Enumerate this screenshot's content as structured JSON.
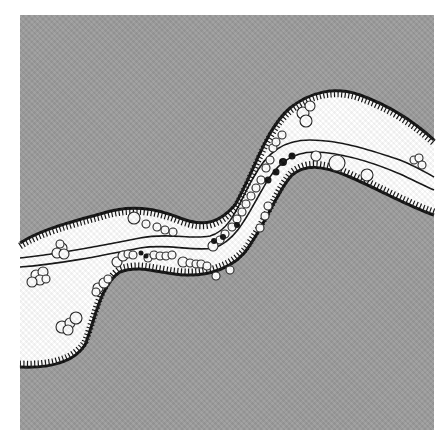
{
  "figure": {
    "colors": {
      "background": "#ffffff",
      "upland": "#9c9c9c",
      "floodplain": "#ffffff",
      "bank_edge": "#111111",
      "channel_line": "#111111",
      "open_circle": "#222222",
      "filled_dot": "#111111"
    },
    "frame": {
      "x": 20,
      "y": 15,
      "width": 414,
      "height": 415
    },
    "open_circles": [
      [
        62,
        248,
        5
      ],
      [
        57,
        253,
        5
      ],
      [
        64,
        254,
        5
      ],
      [
        60,
        244,
        4
      ],
      [
        36,
        275,
        5
      ],
      [
        43,
        272,
        5
      ],
      [
        40,
        280,
        5
      ],
      [
        32,
        282,
        5
      ],
      [
        46,
        279,
        4
      ],
      [
        62,
        327,
        6
      ],
      [
        70,
        323,
        5
      ],
      [
        76,
        318,
        6
      ],
      [
        68,
        330,
        5
      ],
      [
        98,
        288,
        5
      ],
      [
        104,
        283,
        5
      ],
      [
        108,
        279,
        4
      ],
      [
        96,
        292,
        4
      ],
      [
        117,
        262,
        5
      ],
      [
        123,
        256,
        5
      ],
      [
        128,
        254,
        4
      ],
      [
        133,
        255,
        4
      ],
      [
        148,
        258,
        4
      ],
      [
        154,
        255,
        4
      ],
      [
        160,
        256,
        4
      ],
      [
        166,
        256,
        4
      ],
      [
        172,
        255,
        4
      ],
      [
        183,
        262,
        5
      ],
      [
        190,
        263,
        4
      ],
      [
        196,
        264,
        4
      ],
      [
        201,
        264,
        4
      ],
      [
        207,
        266,
        4
      ],
      [
        134,
        218,
        6
      ],
      [
        146,
        224,
        4
      ],
      [
        157,
        227,
        4
      ],
      [
        165,
        230,
        4
      ],
      [
        173,
        232,
        4
      ],
      [
        213,
        246,
        5
      ],
      [
        220,
        240,
        4
      ],
      [
        225,
        234,
        4
      ],
      [
        232,
        227,
        4
      ],
      [
        237,
        219,
        4
      ],
      [
        242,
        212,
        4
      ],
      [
        246,
        204,
        4
      ],
      [
        251,
        196,
        4
      ],
      [
        256,
        188,
        4
      ],
      [
        261,
        180,
        4
      ],
      [
        266,
        168,
        4
      ],
      [
        270,
        160,
        4
      ],
      [
        273,
        148,
        4
      ],
      [
        282,
        135,
        4
      ],
      [
        276,
        142,
        4
      ],
      [
        303,
        113,
        6
      ],
      [
        310,
        106,
        5
      ],
      [
        306,
        121,
        6
      ],
      [
        316,
        156,
        5
      ],
      [
        337,
        163,
        8
      ],
      [
        367,
        175,
        6
      ],
      [
        414,
        160,
        4
      ],
      [
        419,
        158,
        4
      ],
      [
        422,
        165,
        4
      ],
      [
        216,
        276,
        4
      ],
      [
        230,
        270,
        4
      ],
      [
        260,
        228,
        4
      ],
      [
        265,
        216,
        4
      ],
      [
        268,
        206,
        4
      ]
    ],
    "filled_dots": [
      [
        268,
        180,
        3.5
      ],
      [
        276,
        172,
        3.5
      ],
      [
        283,
        162,
        4
      ],
      [
        292,
        156,
        3.5
      ],
      [
        141,
        253,
        2.5
      ],
      [
        146,
        256,
        2.5
      ],
      [
        214,
        241,
        3
      ],
      [
        223,
        237,
        3
      ],
      [
        237,
        225,
        3
      ]
    ]
  }
}
